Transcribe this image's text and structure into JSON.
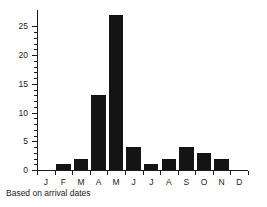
{
  "caption": "Based on arrival dates",
  "chart_data": {
    "type": "bar",
    "title": "",
    "subtitle": "",
    "xlabel": "",
    "ylabel": "",
    "categories": [
      "J",
      "F",
      "M",
      "A",
      "M",
      "J",
      "J",
      "A",
      "S",
      "O",
      "N",
      "D"
    ],
    "category_names": [
      "January",
      "February",
      "March",
      "April",
      "May",
      "June",
      "July",
      "August",
      "September",
      "October",
      "November",
      "December"
    ],
    "values": [
      0,
      1,
      2,
      13,
      27,
      4,
      1,
      2,
      4,
      3,
      2,
      0
    ],
    "ylim": [
      0,
      27.5
    ],
    "xlim": [
      0,
      12
    ],
    "y_major_ticks": [
      0,
      5,
      10,
      15,
      20,
      25
    ],
    "y_tick_labels": [
      "0",
      "5",
      "10",
      "15",
      "20",
      "25"
    ],
    "y_minor_tick_interval": 1,
    "grid": false,
    "legend": false,
    "legend_position": "none",
    "bar_color": "#141414",
    "axis_color": "#1a1a1a",
    "background_color": "#ffffff",
    "annotations": [
      "Based on arrival dates"
    ]
  }
}
